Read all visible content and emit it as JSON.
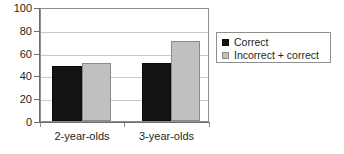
{
  "chart_data": {
    "type": "bar",
    "title": "",
    "xlabel": "",
    "ylabel": "",
    "categories": [
      "2-year-olds",
      "3-year-olds"
    ],
    "series": [
      {
        "name": "Correct",
        "color": "#141414",
        "values": [
          49,
          51.5
        ]
      },
      {
        "name": "Incorrect + correct",
        "color": "#c0c0c0",
        "values": [
          52,
          71.5
        ]
      }
    ],
    "ylim": [
      0,
      100
    ],
    "yticks": [
      0,
      20,
      40,
      60,
      80,
      100
    ],
    "ytick_labels": [
      "0",
      "20",
      "40",
      "60",
      "80",
      "100"
    ],
    "grid": true,
    "grid_axis": "y",
    "legend_position": "right-outside"
  },
  "legend": {
    "entries": [
      {
        "label": "Correct",
        "swatch": "dark"
      },
      {
        "label": "Incorrect + correct",
        "swatch": "light"
      }
    ]
  },
  "axes": {
    "y_tick_labels": [
      "100",
      "80",
      "60",
      "40",
      "20",
      "0"
    ],
    "x_tick_labels": [
      "2-year-olds",
      "3-year-olds"
    ]
  }
}
